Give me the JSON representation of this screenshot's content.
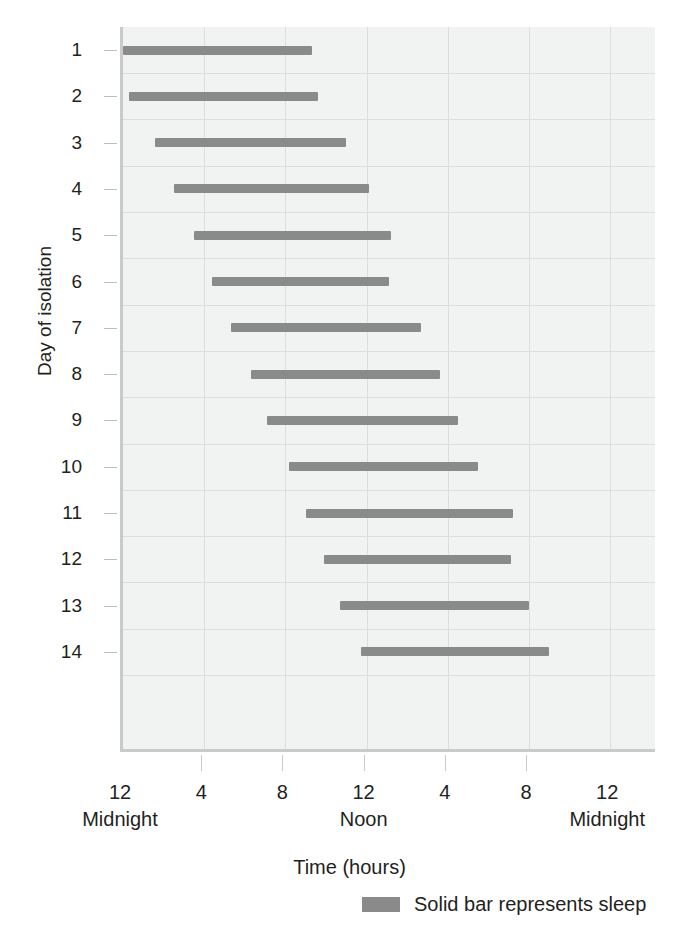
{
  "chart_data": {
    "type": "bar",
    "title": "",
    "xlabel": "Time (hours)",
    "ylabel": "Day of isolation",
    "xlim": [
      0,
      26.3
    ],
    "ylim": [
      0.5,
      14.5
    ],
    "grid": true,
    "legend_position": "bottom-right",
    "bar_color": "#8a8a8a",
    "plot_background": "#f1f2f2",
    "grid_color": "#dcdddf",
    "axis_color": "#c9cacc",
    "x_axis": {
      "label": "Time (hours)",
      "tick_hours": [
        0,
        4,
        8,
        12,
        16,
        20,
        24
      ],
      "tick_numbers": [
        "12",
        "4",
        "8",
        "12",
        "4",
        "8",
        "12"
      ],
      "tick_sublabels": [
        "Midnight",
        "",
        "",
        "Noon",
        "",
        "",
        "Midnight"
      ]
    },
    "y_axis": {
      "label": "Day of isolation",
      "tick_labels": [
        "1",
        "2",
        "3",
        "4",
        "5",
        "6",
        "7",
        "8",
        "9",
        "10",
        "11",
        "12",
        "13",
        "14"
      ]
    },
    "categories": [
      "1",
      "2",
      "3",
      "4",
      "5",
      "6",
      "7",
      "8",
      "9",
      "10",
      "11",
      "12",
      "13",
      "14"
    ],
    "series": [
      {
        "name": "Solid bar represents sleep",
        "value_unit": "hours since midnight",
        "bars": [
          {
            "day": "1",
            "start": 0.0,
            "end": 9.3,
            "duration": 9.3
          },
          {
            "day": "2",
            "start": 0.3,
            "end": 9.6,
            "duration": 9.3
          },
          {
            "day": "3",
            "start": 1.6,
            "end": 11.0,
            "duration": 9.4
          },
          {
            "day": "4",
            "start": 2.5,
            "end": 12.1,
            "duration": 9.6
          },
          {
            "day": "5",
            "start": 3.5,
            "end": 13.2,
            "duration": 9.7
          },
          {
            "day": "6",
            "start": 4.4,
            "end": 13.1,
            "duration": 8.7
          },
          {
            "day": "7",
            "start": 5.3,
            "end": 14.7,
            "duration": 9.4
          },
          {
            "day": "8",
            "start": 6.3,
            "end": 15.6,
            "duration": 9.3
          },
          {
            "day": "9",
            "start": 7.1,
            "end": 16.5,
            "duration": 9.4
          },
          {
            "day": "10",
            "start": 8.2,
            "end": 17.5,
            "duration": 9.3
          },
          {
            "day": "11",
            "start": 9.0,
            "end": 19.2,
            "duration": 10.2
          },
          {
            "day": "12",
            "start": 9.9,
            "end": 19.1,
            "duration": 9.2
          },
          {
            "day": "13",
            "start": 10.7,
            "end": 20.0,
            "duration": 9.3
          },
          {
            "day": "14",
            "start": 11.7,
            "end": 21.0,
            "duration": 9.3
          }
        ]
      }
    ],
    "legend": [
      {
        "label": "Solid bar represents sleep",
        "color": "#8a8a8a",
        "swatch": "solid-bar"
      }
    ]
  }
}
